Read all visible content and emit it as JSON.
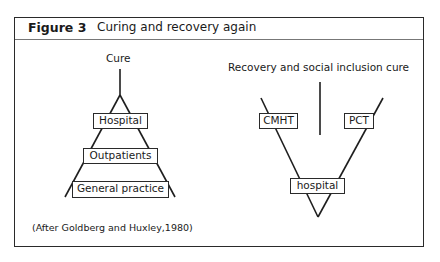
{
  "figure": {
    "number": "Figure 3",
    "title": "Curing and recovery again"
  },
  "left_diagram": {
    "top_label": "Cure",
    "levels": [
      "Hospital",
      "Outpatients",
      "General practice"
    ],
    "citation": "(After Goldberg and Huxley,1980)"
  },
  "right_diagram": {
    "top_label": "Recovery and social inclusion cure",
    "left_node": "CMHT",
    "right_node": "PCT",
    "bottom_node": "hospital"
  }
}
